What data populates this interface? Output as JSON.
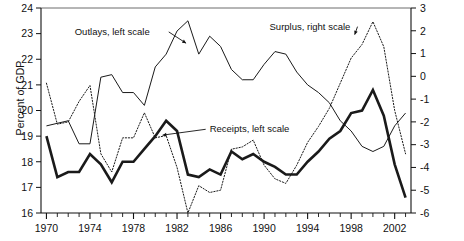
{
  "figure": {
    "y_axis_left_title": "Percent of GDP"
  },
  "annotations": {
    "outlays": "Outlays, left scale",
    "surplus": "Surplus, right scale",
    "receipts": "Receipts, left scale"
  },
  "chart_data": {
    "type": "line",
    "title": "",
    "subtitle": "",
    "xlabel": "",
    "ylabel": "Percent of GDP",
    "ylabel_right": "",
    "grid": false,
    "legend": "inline-annotations",
    "x": [
      1970,
      1971,
      1972,
      1973,
      1974,
      1975,
      1976,
      1977,
      1978,
      1979,
      1980,
      1981,
      1982,
      1983,
      1984,
      1985,
      1986,
      1987,
      1988,
      1989,
      1990,
      1991,
      1992,
      1993,
      1994,
      1995,
      1996,
      1997,
      1998,
      1999,
      2000,
      2001,
      2002,
      2003
    ],
    "xlim": [
      1969.5,
      2003.5
    ],
    "xticks_major": [
      1970,
      1974,
      1978,
      1982,
      1986,
      1990,
      1994,
      1998,
      2002
    ],
    "xticklabels": [
      "1970",
      "1974",
      "1978",
      "1982",
      "1986",
      "1990",
      "1994",
      "1998",
      "2002"
    ],
    "xticks_minor_every": 1,
    "ylim_left": [
      16,
      24
    ],
    "yticks_left": [
      16,
      17,
      18,
      19,
      20,
      21,
      22,
      23,
      24
    ],
    "yticklabels_left": [
      "16",
      "17",
      "18",
      "19",
      "20",
      "21",
      "22",
      "23",
      "24"
    ],
    "ylim_right": [
      -6,
      3
    ],
    "yticks_right": [
      -6,
      -5,
      -4,
      -3,
      -2,
      -1,
      0,
      1,
      2,
      3
    ],
    "yticklabels_right": [
      "-6",
      "-5",
      "-4",
      "-3",
      "-2",
      "-1",
      "0",
      "1",
      "2",
      "3"
    ],
    "series": [
      {
        "name": "Outlays, left scale",
        "axis": "left",
        "style": "thin-solid",
        "color": "#1a1a1a",
        "width": 1.0,
        "values": [
          19.4,
          19.5,
          19.6,
          18.7,
          18.7,
          21.3,
          21.4,
          20.7,
          20.7,
          20.2,
          21.7,
          22.2,
          23.1,
          23.5,
          22.2,
          22.9,
          22.5,
          21.6,
          21.2,
          21.2,
          21.8,
          22.3,
          22.2,
          21.5,
          21.0,
          20.7,
          20.3,
          19.6,
          19.2,
          18.6,
          18.4,
          18.6,
          19.4,
          19.9
        ]
      },
      {
        "name": "Receipts, left scale",
        "axis": "left",
        "style": "thick-solid",
        "color": "#1a1a1a",
        "width": 2.6,
        "values": [
          19.0,
          17.4,
          17.6,
          17.6,
          18.3,
          17.9,
          17.2,
          18.0,
          18.0,
          18.5,
          19.0,
          19.6,
          19.2,
          17.5,
          17.4,
          17.7,
          17.5,
          18.4,
          18.1,
          18.3,
          18.0,
          17.8,
          17.5,
          17.5,
          18.0,
          18.4,
          18.9,
          19.2,
          19.9,
          20.0,
          20.8,
          19.8,
          17.9,
          16.6
        ]
      },
      {
        "name": "Surplus, right scale",
        "axis": "right",
        "style": "dotted",
        "color": "#1a1a1a",
        "width": 1.0,
        "values": [
          -0.3,
          -2.1,
          -2.0,
          -1.1,
          -0.4,
          -3.4,
          -4.2,
          -2.7,
          -2.7,
          -1.6,
          -2.7,
          -2.6,
          -4.0,
          -6.0,
          -4.8,
          -5.1,
          -5.0,
          -3.2,
          -3.1,
          -2.8,
          -3.9,
          -4.5,
          -4.7,
          -3.9,
          -2.9,
          -2.2,
          -1.4,
          -0.3,
          0.8,
          1.4,
          2.4,
          1.3,
          -1.5,
          -3.4
        ]
      }
    ],
    "annotations": [
      {
        "text": "Outlays, left scale",
        "x": 1972.6,
        "y_left": 22.95,
        "arrow_to_x": 1983.2,
        "arrow_to_y_left": 22.9
      },
      {
        "text": "Surplus, right scale",
        "x": 1990.5,
        "y_right": 2.05,
        "arrow_to_x": 1998.6,
        "arrow_to_y_right": 2.05
      },
      {
        "text": "Receipts, left scale",
        "x": 1985.0,
        "y_left": 19.15,
        "arrow_to_x": 1980.4,
        "arrow_to_y_left": 19.0
      }
    ]
  }
}
